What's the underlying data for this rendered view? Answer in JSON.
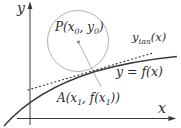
{
  "diagram": {
    "labels": {
      "y_axis": "y",
      "x_axis": "x",
      "center": {
        "pre": "P(x",
        "sub1": "0",
        "mid": ", y",
        "sub2": "0",
        "post": ")"
      },
      "tangent": {
        "pre": "y",
        "sub": "tan",
        "post": "(x)"
      },
      "curve": "y = f(x)",
      "point": {
        "pre": "A(x",
        "sub1": "1",
        "mid": ", f(x",
        "sub2": "1",
        "post": "))"
      }
    },
    "colors": {
      "ink": "#3a3a3a",
      "light_gray": "#b3b3b3",
      "background": "#ffffff"
    }
  }
}
